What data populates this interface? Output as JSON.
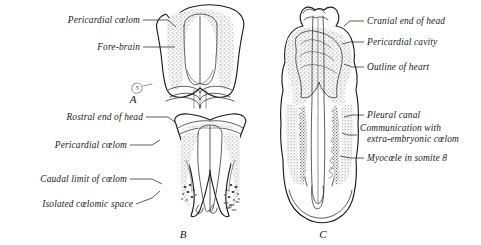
{
  "figure": {
    "background_color": "#ffffff",
    "ink_color": "#1c1c1c",
    "stipple_color": "#9a9a9a",
    "panels": [
      {
        "id": "A",
        "letter": "A",
        "letter_x": 133,
        "letter_y": 103
      },
      {
        "id": "B",
        "letter": "B",
        "letter_x": 183,
        "letter_y": 238
      },
      {
        "id": "C",
        "letter": "C",
        "letter_x": 323,
        "letter_y": 238
      }
    ],
    "somite_markers": [
      {
        "panel": "A",
        "text": "5",
        "x": 139,
        "y": 86
      },
      {
        "panel": "B",
        "text": "8",
        "x": 227,
        "y": 206
      }
    ]
  },
  "labels": {
    "panel_a": [
      {
        "name": "pericardial-coelom-a",
        "text": "Pericardial cœlom",
        "text_x": 140,
        "text_y": 23,
        "align": "end",
        "leader": "M143,20 L168,20 L176,27"
      },
      {
        "name": "fore-brain-a",
        "text": "Fore-brain",
        "text_x": 140,
        "text_y": 50,
        "align": "end",
        "leader": "M143,47 L175,47"
      }
    ],
    "panel_b": [
      {
        "name": "rostral-end-of-head-b",
        "text": "Rostral end of head",
        "text_x": 143,
        "text_y": 120,
        "align": "end",
        "leader": "M146,117 L168,117 L176,123"
      },
      {
        "name": "pericardial-coelom-b",
        "text": "Pericardial cœlom",
        "text_x": 127,
        "text_y": 148,
        "align": "end",
        "leader": "M130,145 L152,145 L160,140"
      },
      {
        "name": "caudal-limit-of-coelom-b",
        "text": "Caudal limit of cœlom",
        "text_x": 127,
        "text_y": 182,
        "align": "end",
        "leader": "M130,179 L152,179 L162,184"
      },
      {
        "name": "isolated-coelomic-space-b",
        "text": "Isolated cœlomic space",
        "text_x": 133,
        "text_y": 207,
        "align": "end",
        "leader": "M136,204 L152,198 L160,191"
      }
    ],
    "panel_c": [
      {
        "name": "cranial-end-of-head-c",
        "text": "Cranial end of head",
        "text_x": 367,
        "text_y": 24,
        "align": "start",
        "leader": "M364,21 L350,21 L344,26"
      },
      {
        "name": "pericardial-cavity-c",
        "text": "Pericardial cavity",
        "text_x": 367,
        "text_y": 45,
        "align": "start",
        "leader": "M364,42 L350,42 L342,44"
      },
      {
        "name": "outline-of-heart-c",
        "text": "Outline of heart",
        "text_x": 367,
        "text_y": 70,
        "align": "start",
        "leader": "M364,67 L352,67 L344,64"
      },
      {
        "name": "pleural-canal-c",
        "text": "Pleural canal",
        "text_x": 367,
        "text_y": 118,
        "align": "start",
        "leader": "M364,115 L352,115 L344,117"
      },
      {
        "name": "communication-extra-embryonic-coelom-c",
        "text": "Communication with",
        "text_x": 360,
        "text_y": 131,
        "align": "start",
        "leader": "M357,135 L348,135 L342,133"
      },
      {
        "name": "communication-extra-embryonic-coelom-line2",
        "text": "extra-embryonic cœlom",
        "text_x": 367,
        "text_y": 142,
        "align": "start",
        "leader": ""
      },
      {
        "name": "myocoele-in-somite-8-c",
        "text": "Myocœle in somite 8",
        "text_x": 367,
        "text_y": 161,
        "align": "start",
        "leader": "M364,158 L350,158 L340,156"
      }
    ]
  }
}
